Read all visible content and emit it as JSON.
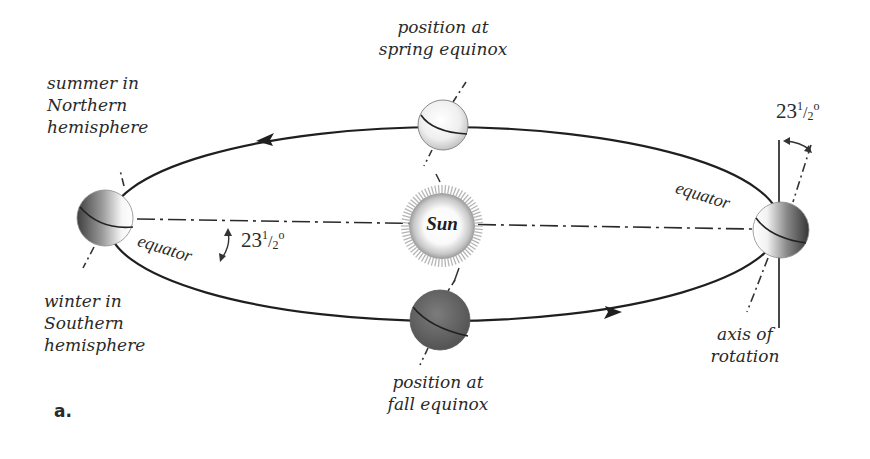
{
  "figure": {
    "label": "a."
  },
  "sun": {
    "label": "Sun"
  },
  "labels": {
    "summer_north": [
      "summer in",
      "Northern",
      "hemisphere"
    ],
    "winter_south": [
      "winter in",
      "Southern",
      "hemisphere"
    ],
    "spring_equinox": [
      "position at",
      "spring equinox"
    ],
    "fall_equinox": [
      "position at",
      "fall equinox"
    ],
    "axis_of_rotation": [
      "axis of",
      "rotation"
    ],
    "equator_left": "equator",
    "equator_right": "equator"
  },
  "angles": {
    "left": {
      "whole": "23",
      "num": "1",
      "den": "2",
      "unit": "o"
    },
    "right": {
      "whole": "23",
      "num": "1",
      "den": "2",
      "unit": "o"
    }
  },
  "orbit": {
    "direction": "counterclockwise (top arrow points left, bottom arrow points right)",
    "stroke": "#1f1f1f"
  },
  "colors": {
    "text": "#2a2a2a",
    "planet_light": "#f4f4f4",
    "planet_dark": "#4a4a4a",
    "fall_planet": "#6a6a6a",
    "sun_ray": "#b5b5b5"
  }
}
